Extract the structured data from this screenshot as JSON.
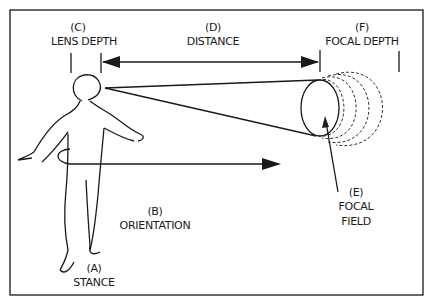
{
  "diagram": {
    "labels": {
      "lens_depth": {
        "letter": "(C)",
        "text": "LENS  DEPTH"
      },
      "distance": {
        "letter": "(D)",
        "text": "DISTANCE"
      },
      "focal_depth": {
        "letter": "(F)",
        "text": "FOCAL  DEPTH"
      },
      "orientation": {
        "letter": "(B)",
        "text": "ORIENTATION"
      },
      "stance": {
        "letter": "(A)",
        "text": "STANCE"
      },
      "focal_field": {
        "letter": "(E)",
        "line1": "FOCAL",
        "line2": "FIELD"
      }
    },
    "colors": {
      "ink": "#1a1a1a",
      "background": "#ffffff"
    }
  }
}
